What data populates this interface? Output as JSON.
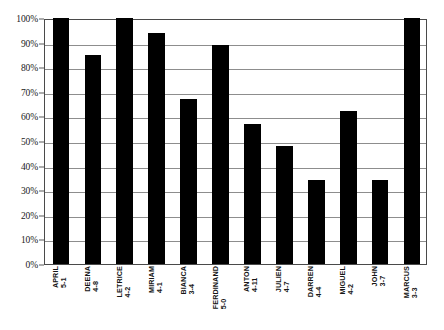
{
  "chart_data": {
    "type": "bar",
    "title": "",
    "subtitle": "",
    "xlabel": "",
    "ylabel": "",
    "ylim": [
      0,
      100
    ],
    "ytick_labels": [
      "100%",
      "90%",
      "80%",
      "70%",
      "60%",
      "50%",
      "40%",
      "30%",
      "20%",
      "10%",
      "0%"
    ],
    "ytick_values": [
      100,
      90,
      80,
      70,
      60,
      50,
      40,
      30,
      20,
      10,
      0
    ],
    "grid": "horizontal",
    "legend": "none",
    "bar_color": "#000000",
    "categories": [
      "APRIL 5-1",
      "DEENA 4-8",
      "LETRICE 4-2",
      "MIRIAM 4-1",
      "BIANCA 3-4",
      "FERDINAND 5-0",
      "ANTON 4-11",
      "JULIEN 4-7",
      "DARREN 4-4",
      "MIGUEL 4-2",
      "JOHN 3-7",
      "MARCUS 3-3"
    ],
    "category_parts": [
      {
        "name": "APRIL",
        "code": "5-1"
      },
      {
        "name": "DEENA",
        "code": "4-8"
      },
      {
        "name": "LETRICE",
        "code": "4-2"
      },
      {
        "name": "MIRIAM",
        "code": "4-1"
      },
      {
        "name": "BIANCA",
        "code": "3-4"
      },
      {
        "name": "FERDINAND",
        "code": "5-0"
      },
      {
        "name": "ANTON",
        "code": "4-11"
      },
      {
        "name": "JULIEN",
        "code": "4-7"
      },
      {
        "name": "DARREN",
        "code": "4-4"
      },
      {
        "name": "MIGUEL",
        "code": "4-2"
      },
      {
        "name": "JOHN",
        "code": "3-7"
      },
      {
        "name": "MARCUS",
        "code": "3-3"
      }
    ],
    "values": [
      100,
      85,
      100,
      94,
      67,
      89,
      57,
      48,
      34,
      62,
      34,
      100
    ]
  }
}
